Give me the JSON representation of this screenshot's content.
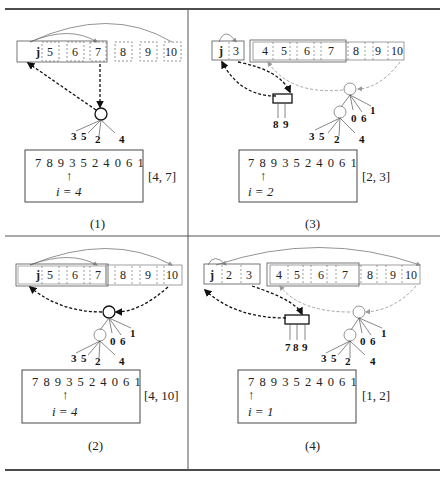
{
  "figure": {
    "panels": [
      {
        "caption": "(1)",
        "array_cells": [
          "j",
          "5",
          "6",
          "7",
          "8",
          "9",
          "10"
        ],
        "leaf_labels": [
          "3",
          "5",
          "2",
          "4"
        ],
        "sequence": "7 8 9 3 5 2 4 0 6 1",
        "arrow": "↑",
        "index_text": "i = 4",
        "interval": "[4, 7]"
      },
      {
        "caption": "(2)",
        "array_cells": [
          "j",
          "5",
          "6",
          "7",
          "8",
          "9",
          "10"
        ],
        "leaf_labels": [
          "3",
          "5",
          "2",
          "4"
        ],
        "extra_labels": [
          "0",
          "6",
          "1"
        ],
        "sequence": "7 8 9 3 5 2 4 0 6 1",
        "arrow": "↑",
        "index_text": "i = 4",
        "interval": "[4, 10]"
      },
      {
        "caption": "(3)",
        "array_cells": [
          "j",
          "3",
          "4",
          "5",
          "6",
          "7",
          "8",
          "9",
          "10"
        ],
        "leaf_labels": [
          "3",
          "5",
          "2",
          "4"
        ],
        "extra_labels": [
          "0",
          "6",
          "1"
        ],
        "box_labels": [
          "8",
          "9"
        ],
        "sequence": "7 8 9 3 5 2 4 0 6 1",
        "arrow": "↑",
        "index_text": "i = 2",
        "interval": "[2, 3]"
      },
      {
        "caption": "(4)",
        "array_cells": [
          "j",
          "2",
          "3",
          "4",
          "5",
          "6",
          "7",
          "8",
          "9",
          "10"
        ],
        "leaf_labels": [
          "3",
          "5",
          "2",
          "4"
        ],
        "extra_labels": [
          "0",
          "6",
          "1"
        ],
        "box_labels": [
          "7",
          "8",
          "9"
        ],
        "sequence": "7 8 9 3 5 2 4 0 6 1",
        "arrow": "↑",
        "index_text": "i = 1",
        "interval": "[1, 2]"
      }
    ]
  }
}
